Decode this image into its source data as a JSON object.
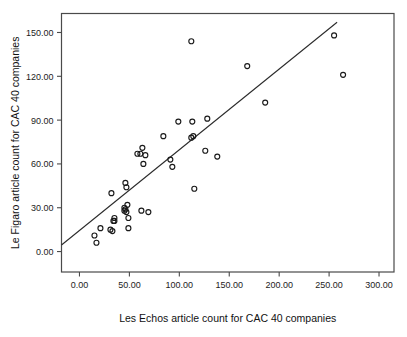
{
  "chart_data": {
    "type": "scatter",
    "title": "",
    "xlabel": "Les Echos article count for CAC 40 companies",
    "ylabel": "Le Figaro article count for CAC 40 companies",
    "xlim": [
      -18,
      315
    ],
    "ylim": [
      -14,
      163
    ],
    "xticks": [
      0,
      50,
      100,
      150,
      200,
      250,
      300
    ],
    "xtick_labels": [
      "0.00",
      "50.00",
      "100.00",
      "150.00",
      "200.00",
      "250.00",
      "300.00"
    ],
    "yticks": [
      0,
      30,
      60,
      90,
      120,
      150
    ],
    "ytick_labels": [
      "0.00",
      "30.00",
      "60.00",
      "90.00",
      "120.00",
      "150.00"
    ],
    "grid": false,
    "legend": false,
    "marker": "open-circle",
    "marker_color": "#1a1a1a",
    "points": [
      {
        "x": 15,
        "y": 11
      },
      {
        "x": 17,
        "y": 6
      },
      {
        "x": 21,
        "y": 16
      },
      {
        "x": 31,
        "y": 15
      },
      {
        "x": 32,
        "y": 40
      },
      {
        "x": 33,
        "y": 14
      },
      {
        "x": 34,
        "y": 21
      },
      {
        "x": 35,
        "y": 21
      },
      {
        "x": 35,
        "y": 23
      },
      {
        "x": 45,
        "y": 30
      },
      {
        "x": 45,
        "y": 28
      },
      {
        "x": 46,
        "y": 29
      },
      {
        "x": 46,
        "y": 47
      },
      {
        "x": 47,
        "y": 44
      },
      {
        "x": 47,
        "y": 27
      },
      {
        "x": 48,
        "y": 32
      },
      {
        "x": 49,
        "y": 23
      },
      {
        "x": 49,
        "y": 16
      },
      {
        "x": 58,
        "y": 67
      },
      {
        "x": 61,
        "y": 67
      },
      {
        "x": 62,
        "y": 28
      },
      {
        "x": 63,
        "y": 71
      },
      {
        "x": 64,
        "y": 60
      },
      {
        "x": 66,
        "y": 66
      },
      {
        "x": 69,
        "y": 27
      },
      {
        "x": 84,
        "y": 79
      },
      {
        "x": 91,
        "y": 63
      },
      {
        "x": 93,
        "y": 58
      },
      {
        "x": 99,
        "y": 89
      },
      {
        "x": 112,
        "y": 144
      },
      {
        "x": 112,
        "y": 78
      },
      {
        "x": 113,
        "y": 89
      },
      {
        "x": 114,
        "y": 79
      },
      {
        "x": 115,
        "y": 43
      },
      {
        "x": 126,
        "y": 69
      },
      {
        "x": 128,
        "y": 91
      },
      {
        "x": 138,
        "y": 65
      },
      {
        "x": 168,
        "y": 127
      },
      {
        "x": 186,
        "y": 102
      },
      {
        "x": 255,
        "y": 148
      },
      {
        "x": 264,
        "y": 121
      }
    ],
    "fit_line": {
      "label": "linear fit",
      "x_start": -18,
      "y_start": 4.5,
      "x_end": 258,
      "y_end": 157,
      "color": "#2b2b2b"
    }
  }
}
